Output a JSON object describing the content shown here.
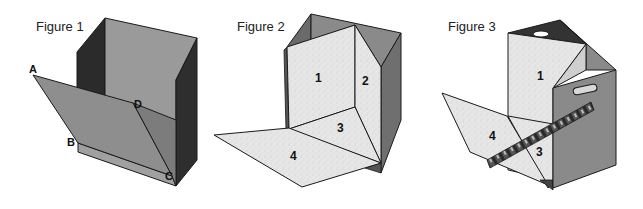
{
  "figures": [
    {
      "title": "Figure 1",
      "vertex_labels": [
        "A",
        "B",
        "C",
        "D"
      ]
    },
    {
      "title": "Figure 2",
      "panel_labels": [
        "1",
        "2",
        "3",
        "4"
      ]
    },
    {
      "title": "Figure 3",
      "panel_labels": [
        "1",
        "3",
        "4"
      ]
    }
  ],
  "colors": {
    "background": "#ffffff",
    "dark_side": "#2e2e2e",
    "mid_grey_face": "#8c8c8c",
    "light_grey_face": "#9e9e9e",
    "speckled_panel": "#e4e4e4",
    "grey_panel": "#8a8a8a",
    "outline": "#1a1a1a"
  }
}
